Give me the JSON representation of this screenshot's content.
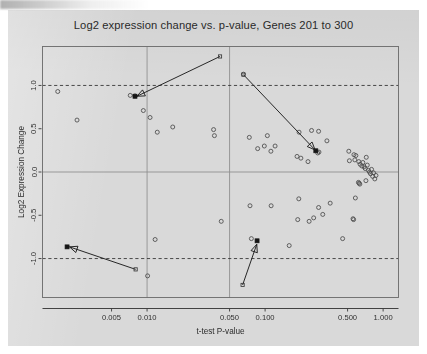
{
  "figure": {
    "title": "Log2 expression change vs. p-value, Genes 201 to 300"
  },
  "chart_data": {
    "type": "scatter",
    "title": "Log2 expression change vs. p-value, Genes 201 to 300",
    "xlabel": "t-test P-value",
    "ylabel": "Log2 Expression Change",
    "x_scale": "log",
    "xlim": [
      0.0013,
      1.35
    ],
    "ylim": [
      -1.45,
      1.45
    ],
    "grid": true,
    "legend": "none",
    "x_ticks": [
      0.005,
      0.01,
      0.05,
      0.1,
      0.5,
      1.0
    ],
    "x_tick_labels": [
      "0.005",
      "0.010",
      "0.050",
      "0.100",
      "0.500",
      "1.000"
    ],
    "y_ticks": [
      -1.0,
      -0.5,
      0.0,
      0.5,
      1.0
    ],
    "y_tick_labels": [
      "-1.0",
      "-0.5",
      "0.0",
      "0.5",
      "1.0"
    ],
    "gridlines_vertical": [
      0.01,
      0.05
    ],
    "gridlines_horizontal_solid": [
      0.0
    ],
    "reference_lines_dashed": [
      1.0,
      -1.0
    ],
    "marker": "open-circle",
    "points": [
      {
        "p": 0.00175,
        "log2": 0.93
      },
      {
        "p": 0.00255,
        "log2": 0.6
      },
      {
        "p": 0.0079,
        "log2": 0.88
      },
      {
        "p": 0.0093,
        "log2": 0.71
      },
      {
        "p": 0.0106,
        "log2": 0.63
      },
      {
        "p": 0.0122,
        "log2": 0.46
      },
      {
        "p": 0.0165,
        "log2": 0.52
      },
      {
        "p": 0.0366,
        "log2": 0.49
      },
      {
        "p": 0.0372,
        "log2": 0.42
      },
      {
        "p": 0.0117,
        "log2": -0.78
      },
      {
        "p": 0.0101,
        "log2": -1.2
      },
      {
        "p": 0.0425,
        "log2": -0.57
      },
      {
        "p": 0.0655,
        "log2": 1.13
      },
      {
        "p": 0.0735,
        "log2": 0.4
      },
      {
        "p": 0.0865,
        "log2": 0.27
      },
      {
        "p": 0.0985,
        "log2": 0.3
      },
      {
        "p": 0.1045,
        "log2": 0.42
      },
      {
        "p": 0.112,
        "log2": 0.24
      },
      {
        "p": 0.1215,
        "log2": 0.3
      },
      {
        "p": 0.194,
        "log2": 0.46
      },
      {
        "p": 0.1865,
        "log2": 0.18
      },
      {
        "p": 0.201,
        "log2": 0.16
      },
      {
        "p": 0.231,
        "log2": 0.12
      },
      {
        "p": 0.2475,
        "log2": 0.48
      },
      {
        "p": 0.286,
        "log2": 0.23
      },
      {
        "p": 0.279,
        "log2": 0.22
      },
      {
        "p": 0.284,
        "log2": 0.47
      },
      {
        "p": 0.334,
        "log2": 0.36
      },
      {
        "p": 0.512,
        "log2": 0.24
      },
      {
        "p": 0.518,
        "log2": 0.13
      },
      {
        "p": 0.566,
        "log2": 0.2
      },
      {
        "p": 0.588,
        "log2": 0.19
      },
      {
        "p": 0.576,
        "log2": 0.14
      },
      {
        "p": 0.622,
        "log2": 0.12
      },
      {
        "p": 0.638,
        "log2": 0.09
      },
      {
        "p": 0.66,
        "log2": 0.07
      },
      {
        "p": 0.673,
        "log2": 0.11
      },
      {
        "p": 0.69,
        "log2": 0.06
      },
      {
        "p": 0.705,
        "log2": 0.04
      },
      {
        "p": 0.72,
        "log2": 0.17
      },
      {
        "p": 0.734,
        "log2": 0.08
      },
      {
        "p": 0.75,
        "log2": 0.02
      },
      {
        "p": 0.766,
        "log2": 0.0
      },
      {
        "p": 0.782,
        "log2": -0.02
      },
      {
        "p": 0.798,
        "log2": 0.03
      },
      {
        "p": 0.815,
        "log2": -0.05
      },
      {
        "p": 0.83,
        "log2": -0.01
      },
      {
        "p": 0.85,
        "log2": -0.08
      },
      {
        "p": 0.87,
        "log2": -0.04
      },
      {
        "p": 0.626,
        "log2": -0.13
      },
      {
        "p": 0.635,
        "log2": -0.14
      },
      {
        "p": 0.618,
        "log2": -0.12
      },
      {
        "p": 0.715,
        "log2": -0.1
      },
      {
        "p": 0.582,
        "log2": -0.3
      },
      {
        "p": 0.0745,
        "log2": -0.39
      },
      {
        "p": 0.1125,
        "log2": -0.39
      },
      {
        "p": 0.193,
        "log2": -0.31
      },
      {
        "p": 0.189,
        "log2": -0.55
      },
      {
        "p": 0.236,
        "log2": -0.57
      },
      {
        "p": 0.258,
        "log2": -0.53
      },
      {
        "p": 0.284,
        "log2": -0.41
      },
      {
        "p": 0.308,
        "log2": -0.49
      },
      {
        "p": 0.356,
        "log2": -0.36
      },
      {
        "p": 0.454,
        "log2": -0.77
      },
      {
        "p": 0.556,
        "log2": -0.54
      },
      {
        "p": 0.562,
        "log2": -0.55
      },
      {
        "p": 0.16,
        "log2": -0.85
      },
      {
        "p": 0.0765,
        "log2": -0.77
      },
      {
        "p": 0.0072,
        "log2": 0.885
      }
    ],
    "highlighted_points": [
      {
        "p": 0.0079,
        "log2": 0.875,
        "marker": "filled-square"
      },
      {
        "p": 0.269,
        "log2": 0.245,
        "marker": "filled-square"
      },
      {
        "p": 0.0021,
        "log2": -0.865,
        "marker": "filled-square"
      },
      {
        "p": 0.0855,
        "log2": -0.795,
        "marker": "filled-square"
      }
    ],
    "annotations": [
      {
        "name": "arrow-upper-left",
        "tail_p": 0.0415,
        "tail_log2": 1.335,
        "head_p": 0.0082,
        "head_log2": 0.875
      },
      {
        "name": "arrow-upper-right",
        "tail_p": 0.0655,
        "tail_log2": 1.125,
        "head_p": 0.265,
        "head_log2": 0.255
      },
      {
        "name": "arrow-lower-left",
        "tail_p": 0.008,
        "tail_log2": -1.125,
        "head_p": 0.0022,
        "head_log2": -0.865
      },
      {
        "name": "arrow-lower-center",
        "tail_p": 0.0645,
        "tail_log2": -1.305,
        "head_p": 0.085,
        "head_log2": -0.835
      }
    ]
  }
}
